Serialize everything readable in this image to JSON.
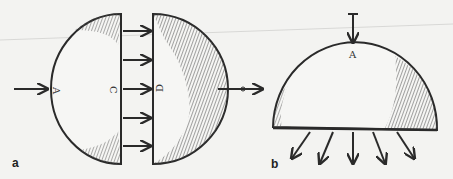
{
  "figure": {
    "panels": [
      {
        "id": "a",
        "label": "a",
        "description": "Sphere split into two hemispheres with parallel force arrows between the cut faces",
        "point_labels": {
          "left_pole": "A",
          "left_face": "C",
          "right_face": "D",
          "right_pole": "B"
        },
        "arrow_count_between_faces": 5
      },
      {
        "id": "b",
        "label": "b",
        "description": "Hemisphere with downward load at apex and radiating force arrows below the base",
        "point_labels": {
          "apex": "A"
        },
        "arrow_count_below_base": 5
      }
    ],
    "colors": {
      "ink": "#2a2a2a",
      "paper": "#f3f3f1",
      "hatch": "#555555"
    }
  }
}
